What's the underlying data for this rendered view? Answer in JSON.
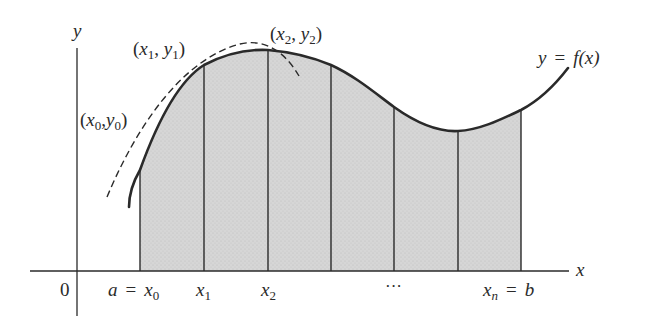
{
  "figure": {
    "type": "trapezoidal-rule-illustration",
    "colors": {
      "background": "#ffffff",
      "fill": "#d4d4d4",
      "curve": "#2a2a2a",
      "lines": "#2a2a2a"
    }
  },
  "axes": {
    "y_label": "y",
    "x_label": "x",
    "origin_label": "0"
  },
  "curve": {
    "label_y": "y",
    "label_eq": "=",
    "label_f": "f(x)"
  },
  "points": [
    {
      "name": "(x0, y0)",
      "x_sym": "x",
      "x_sub": "0",
      "y_sym": "y",
      "y_sub": "0"
    },
    {
      "name": "(x1, y1)",
      "x_sym": "x",
      "x_sub": "1",
      "y_sym": "y",
      "y_sub": "1"
    },
    {
      "name": "(x2, y2)",
      "x_sym": "x",
      "x_sub": "2",
      "y_sym": "y",
      "y_sub": "2"
    }
  ],
  "ticks": {
    "a": "a",
    "eq": "=",
    "x0": "x",
    "x0_sub": "0",
    "x1": "x",
    "x1_sub": "1",
    "x2": "x",
    "x2_sub": "2",
    "ellipsis": "···",
    "xn": "x",
    "xn_sub": "n",
    "b": "b"
  },
  "partition": {
    "count_visible": 7,
    "x_positions": [
      140,
      204,
      268,
      331,
      394,
      458,
      521
    ]
  }
}
